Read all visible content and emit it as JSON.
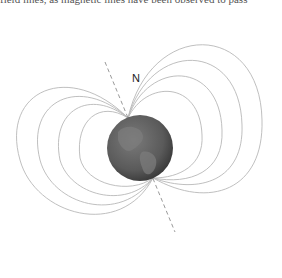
{
  "caption": "field lines, as magnetic lines have been observed to pass",
  "diagram": {
    "north_label": "N",
    "colors": {
      "field_line": "#b5b5b5",
      "axis": "#9a9a9a",
      "globe": "#5f5f5f",
      "globe_dark": "#3f3f3f",
      "land": "#7d7d7d"
    }
  }
}
